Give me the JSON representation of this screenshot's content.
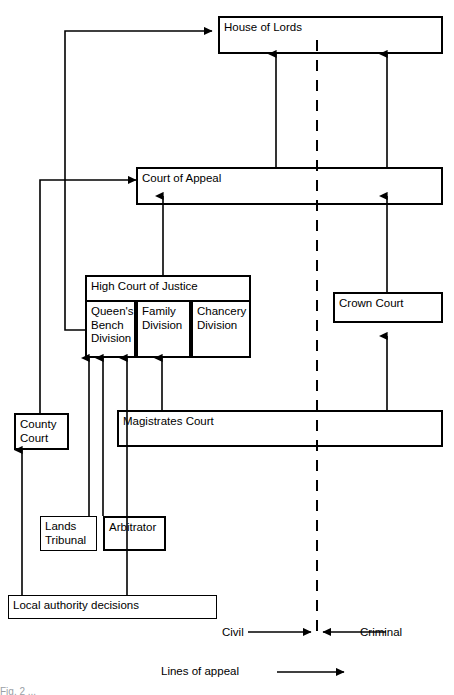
{
  "diagram": {
    "title": "Lines of appeal",
    "stroke_color": "#000000",
    "background_color": "#ffffff",
    "nodes": {
      "house_of_lords": "House of Lords",
      "court_of_appeal": "Court of Appeal",
      "high_court_of_justice": "High Court of Justice",
      "queens_bench_division": "Queen's\nBench\nDivision",
      "family_division": "Family\nDivision",
      "chancery_division": "Chancery\nDivision",
      "crown_court": "Crown Court",
      "county_court": "County\nCourt",
      "magistrates_court": "Magistrates Court",
      "lands_tribunal": "Lands\nTribunal",
      "arbitrator": "Arbitrator",
      "local_authority_decisions": "Local authority decisions"
    },
    "axis": {
      "civil_label": "Civil",
      "criminal_label": "Criminal"
    },
    "legend": {
      "label": "Lines of appeal"
    },
    "footer": {
      "caption": "Fig. 2 ..."
    },
    "appeal_routes": [
      {
        "from": "local_authority_decisions",
        "to": "county_court"
      },
      {
        "from": "local_authority_decisions",
        "to": "queens_bench_division"
      },
      {
        "from": "lands_tribunal",
        "to": "queens_bench_division"
      },
      {
        "from": "arbitrator",
        "to": "queens_bench_division"
      },
      {
        "from": "magistrates_court",
        "to": "queens_bench_division"
      },
      {
        "from": "magistrates_court",
        "to": "family_division"
      },
      {
        "from": "magistrates_court",
        "to": "crown_court"
      },
      {
        "from": "county_court",
        "to": "court_of_appeal"
      },
      {
        "from": "high_court_of_justice",
        "to": "court_of_appeal"
      },
      {
        "from": "crown_court",
        "to": "court_of_appeal"
      },
      {
        "from": "queens_bench_division",
        "to": "house_of_lords"
      },
      {
        "from": "court_of_appeal",
        "to": "house_of_lords"
      }
    ]
  }
}
